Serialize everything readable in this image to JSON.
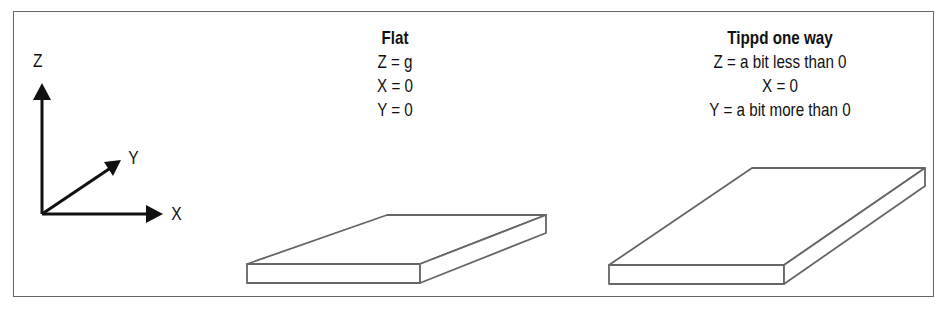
{
  "axes": {
    "z_label": "Z",
    "y_label": "Y",
    "x_label": "X"
  },
  "panels": [
    {
      "title": "Flat",
      "lines": [
        "Z = g",
        "X = 0",
        "Y = 0"
      ]
    },
    {
      "title": "Tippd one way",
      "lines": [
        "Z = a bit less than 0",
        "X = 0",
        "Y = a bit more than 0"
      ]
    }
  ],
  "colors": {
    "stroke": "#111111",
    "slab_stroke": "#666666",
    "frame": "#666666"
  }
}
